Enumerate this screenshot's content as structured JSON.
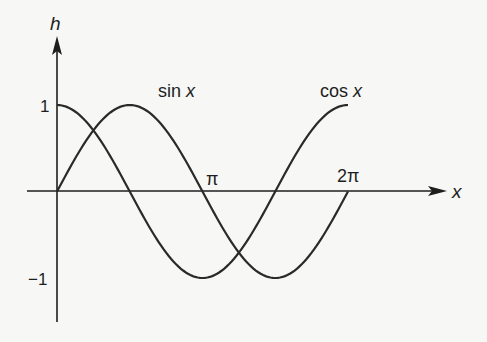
{
  "chart_data": {
    "type": "line",
    "title": "",
    "xlabel": "x",
    "ylabel": "h",
    "xlim": [
      0,
      6.2832
    ],
    "ylim": [
      -1,
      1
    ],
    "grid": false,
    "legend": "inline curve labels",
    "x_tick_labels": [
      {
        "value": 3.1416,
        "label": "π"
      },
      {
        "value": 6.2832,
        "label": "2π"
      }
    ],
    "y_tick_labels": [
      {
        "value": 1,
        "label": "1"
      },
      {
        "value": -1,
        "label": "−1"
      }
    ],
    "series": [
      {
        "name": "sin x",
        "label": "sin x",
        "function": "sin",
        "x": [
          0,
          0.7854,
          1.5708,
          2.3562,
          3.1416,
          3.927,
          4.7124,
          5.4978,
          6.2832
        ],
        "values": [
          0,
          0.707,
          1,
          0.707,
          0,
          -0.707,
          -1,
          -0.707,
          0
        ]
      },
      {
        "name": "cos x",
        "label": "cos x",
        "function": "cos",
        "x": [
          0,
          0.7854,
          1.5708,
          2.3562,
          3.1416,
          3.927,
          4.7124,
          5.4978,
          6.2832
        ],
        "values": [
          1,
          0.707,
          0,
          -0.707,
          -1,
          -0.707,
          0,
          0.707,
          1
        ]
      }
    ],
    "annotations": [
      {
        "text": "sin x",
        "near": "peak of sin x"
      },
      {
        "text": "cos x",
        "near": "end of cos x at 2π"
      }
    ]
  },
  "labels": {
    "y_axis": "h",
    "x_axis": "x",
    "tick_one": "1",
    "tick_minus_one": "−1",
    "tick_pi": "π",
    "tick_two_pi": "2π",
    "sin_label_main": "sin ",
    "sin_label_var": "x",
    "cos_label_main": "cos ",
    "cos_label_var": "x"
  },
  "colors": {
    "ink": "#1e1e1e",
    "paper": "#f7f7f5"
  }
}
